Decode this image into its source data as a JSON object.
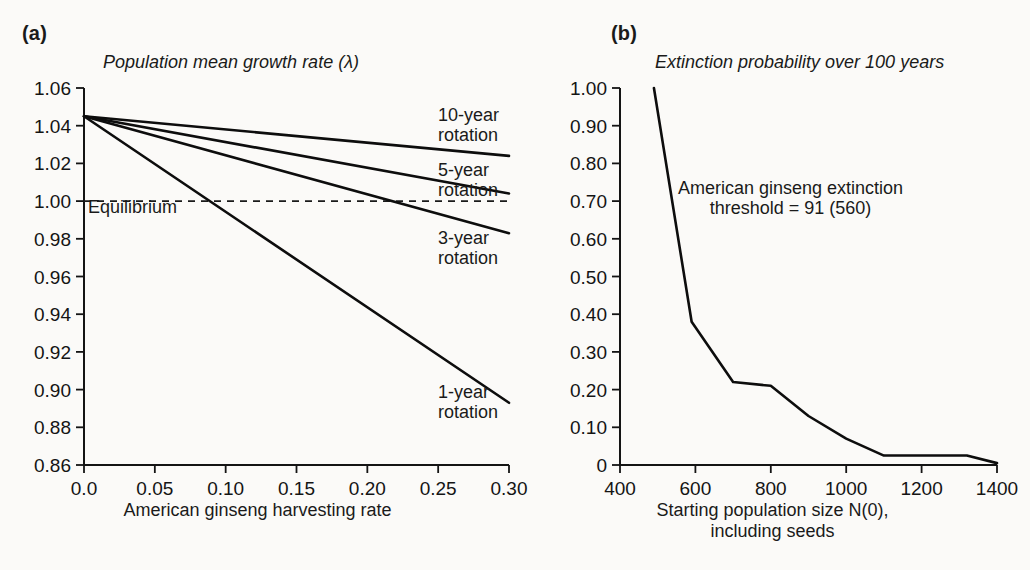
{
  "figure": {
    "background": "#fbfaf8",
    "ink": "#141414"
  },
  "panel_a": {
    "label": "(a)",
    "title": "Population mean growth rate (λ)",
    "xlabel": "American ginseng harvesting rate",
    "equilibrium_label": "Equilibrium",
    "annotations": [
      {
        "key": "rot10",
        "text": "10-year\nrotation"
      },
      {
        "key": "rot5",
        "text": "5-year\nrotation"
      },
      {
        "key": "rot3",
        "text": "3-year\nrotation"
      },
      {
        "key": "rot1",
        "text": "1-year\nrotation"
      }
    ]
  },
  "panel_b": {
    "label": "(b)",
    "title": "Extinction probability over 100 years",
    "xlabel": "Starting population size N(0),\nincluding seeds",
    "annotation": "American ginseng extinction\nthreshold = 91 (560)"
  },
  "chart_data": [
    {
      "type": "line",
      "panel": "(a)",
      "title": "Population mean growth rate (λ)",
      "xlabel": "American ginseng harvesting rate",
      "ylabel": "Population mean growth rate (λ)",
      "xlim": [
        0.0,
        0.3
      ],
      "ylim": [
        0.86,
        1.06
      ],
      "xticks": [
        0.0,
        0.05,
        0.1,
        0.15,
        0.2,
        0.25,
        0.3
      ],
      "xticklabels": [
        "0.0",
        "0.05",
        "0.10",
        "0.15",
        "0.20",
        "0.25",
        "0.30"
      ],
      "yticks": [
        0.86,
        0.88,
        0.9,
        0.92,
        0.94,
        0.96,
        0.98,
        1.0,
        1.02,
        1.04,
        1.06
      ],
      "yticklabels": [
        "0.86",
        "0.88",
        "0.90",
        "0.92",
        "0.94",
        "0.96",
        "0.98",
        "1.00",
        "1.02",
        "1.04",
        "1.06"
      ],
      "grid": false,
      "legend": "inline-annotations",
      "reference_lines": [
        {
          "name": "Equilibrium",
          "axis": "y",
          "value": 1.0,
          "style": "dashed"
        }
      ],
      "series": [
        {
          "name": "10-year rotation",
          "x": [
            0.0,
            0.3
          ],
          "values": [
            1.045,
            1.024
          ]
        },
        {
          "name": "5-year rotation",
          "x": [
            0.0,
            0.3
          ],
          "values": [
            1.045,
            1.004
          ]
        },
        {
          "name": "3-year rotation",
          "x": [
            0.0,
            0.3
          ],
          "values": [
            1.045,
            0.983
          ]
        },
        {
          "name": "1-year rotation",
          "x": [
            0.0,
            0.3
          ],
          "values": [
            1.045,
            0.893
          ]
        }
      ]
    },
    {
      "type": "line",
      "panel": "(b)",
      "title": "Extinction probability over 100 years",
      "xlabel": "Starting population size N(0), including seeds",
      "ylabel": "Extinction probability over 100 years",
      "xlim": [
        400,
        1400
      ],
      "ylim": [
        0,
        1.0
      ],
      "xticks": [
        400,
        600,
        800,
        1000,
        1200,
        1400
      ],
      "xticklabels": [
        "400",
        "600",
        "800",
        "1000",
        "1200",
        "1400"
      ],
      "yticks": [
        0,
        0.1,
        0.2,
        0.3,
        0.4,
        0.5,
        0.6,
        0.7,
        0.8,
        0.9,
        1.0
      ],
      "yticklabels": [
        "0",
        "0.10",
        "0.20",
        "0.30",
        "0.40",
        "0.50",
        "0.60",
        "0.70",
        "0.80",
        "0.90",
        "1.00"
      ],
      "grid": false,
      "annotations": [
        "American ginseng extinction threshold = 91 (560)"
      ],
      "series": [
        {
          "name": "Extinction probability",
          "x": [
            490,
            590,
            700,
            800,
            900,
            1000,
            1100,
            1320,
            1400
          ],
          "values": [
            1.0,
            0.38,
            0.22,
            0.21,
            0.13,
            0.07,
            0.025,
            0.025,
            0.005
          ]
        }
      ]
    }
  ]
}
